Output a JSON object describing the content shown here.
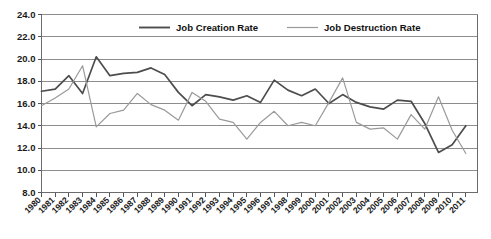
{
  "chart_data": {
    "type": "line",
    "title": "",
    "subtitle": "",
    "xlabel": "",
    "ylabel": "",
    "grid": true,
    "legend_position": "top-center",
    "xlim": [
      1980,
      2011
    ],
    "ylim": [
      8.0,
      24.0
    ],
    "ytick_step": 2.0,
    "ytick_labels": [
      "24.0",
      "22.0",
      "20.0",
      "18.0",
      "16.0",
      "14.0",
      "12.0",
      "10.0",
      "8.0"
    ],
    "ytick_values": [
      24.0,
      22.0,
      20.0,
      18.0,
      16.0,
      14.0,
      12.0,
      10.0,
      8.0
    ],
    "categories": [
      "1980",
      "1981",
      "1982",
      "1983",
      "1984",
      "1985",
      "1986",
      "1987",
      "1988",
      "1989",
      "1990",
      "1991",
      "1992",
      "1993",
      "1994",
      "1995",
      "1996",
      "1997",
      "1998",
      "1999",
      "2000",
      "2001",
      "2002",
      "2003",
      "2004",
      "2005",
      "2006",
      "2007",
      "2008",
      "2009",
      "2010",
      "2011"
    ],
    "series": [
      {
        "name": "Job Creation Rate",
        "color": "#4d4d4d",
        "values": [
          17.1,
          17.3,
          18.5,
          16.9,
          20.2,
          18.5,
          18.7,
          18.8,
          19.2,
          18.6,
          17.0,
          15.8,
          16.8,
          16.6,
          16.3,
          16.7,
          16.1,
          18.1,
          17.2,
          16.7,
          17.3,
          16.0,
          16.8,
          16.1,
          15.7,
          15.5,
          16.3,
          16.2,
          14.2,
          11.6,
          12.3,
          14.0
        ]
      },
      {
        "name": "Job Destruction Rate",
        "color": "#9a9a9a",
        "values": [
          15.8,
          16.5,
          17.3,
          19.4,
          13.9,
          15.1,
          15.4,
          16.9,
          15.9,
          15.4,
          14.5,
          17.0,
          16.2,
          14.6,
          14.3,
          12.8,
          14.3,
          15.3,
          14.0,
          14.3,
          14.0,
          16.1,
          18.3,
          14.3,
          13.7,
          13.8,
          12.8,
          15.0,
          13.7,
          16.6,
          13.6,
          11.5
        ]
      }
    ]
  },
  "legend": {
    "items": [
      {
        "label": "Job Creation Rate",
        "color": "#4d4d4d"
      },
      {
        "label": "Job Destruction Rate",
        "color": "#9a9a9a"
      }
    ]
  }
}
